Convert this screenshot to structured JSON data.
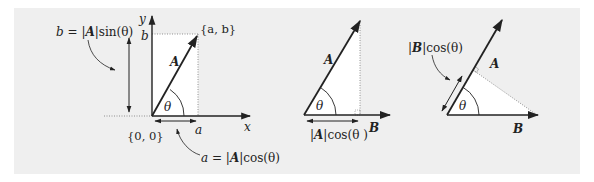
{
  "colors": {
    "panel_bg": "#efefef",
    "triangle_fill": "#ffffff",
    "stroke": "#222222",
    "dotted": "#777777"
  },
  "panel1": {
    "axis_x_label": "x",
    "axis_y_label": "y",
    "vector_label": "A",
    "angle_label": "θ",
    "point_label": "{a, b}",
    "origin_label": "{0, 0}",
    "x_component_label": "a",
    "y_component_label": "b",
    "b_formula": {
      "lhs": "b = ",
      "bar_l": "|",
      "vec": "A",
      "bar_r": "|",
      "rhs": "sin(θ)"
    },
    "a_formula": {
      "lhs": "a = ",
      "bar_l": "|",
      "vec": "A",
      "bar_r": "|",
      "rhs": "cos(θ)"
    }
  },
  "panel2": {
    "vector_a_label": "A",
    "vector_b_label": "B",
    "angle_label": "θ",
    "projection_formula": {
      "bar_l": "|",
      "vec": "A",
      "bar_r": "|",
      "rhs": "cos(θ )"
    }
  },
  "panel3": {
    "vector_a_label": "A",
    "vector_b_label": "B",
    "angle_label": "θ",
    "projection_formula": {
      "bar_l": "|",
      "vec": "B",
      "bar_r": "|",
      "rhs": "cos(θ)"
    }
  }
}
